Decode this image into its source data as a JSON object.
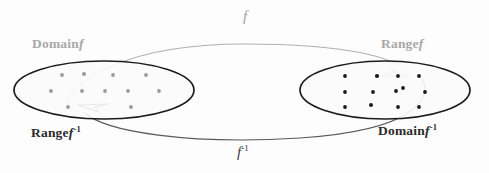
{
  "figure": {
    "colors": {
      "gray": "#a8a8a8",
      "dark": "#2c2c2c",
      "ellipse_stroke": "#1c1c1c",
      "ellipse_fill": "#fbfbfb",
      "curve_f": "#aaaaaa",
      "curve_f_inverse": "#555555",
      "dot_left": "#9a9a9a",
      "dot_right": "#1a1a1a",
      "background": "#fdfdfd"
    }
  },
  "labels": {
    "domain_f": {
      "word": "Domain",
      "symbol": "f",
      "exponent": ""
    },
    "range_f": {
      "word": "Range",
      "symbol": "f",
      "exponent": ""
    },
    "range_f_inverse": {
      "word": "Range",
      "symbol": "f",
      "exponent": "-1"
    },
    "domain_f_inverse": {
      "word": "Domain",
      "symbol": "f",
      "exponent": "-1"
    },
    "curve_top": {
      "symbol": "f",
      "exponent": ""
    },
    "curve_bottom": {
      "symbol": "f",
      "exponent": "-1"
    }
  },
  "left_set": {
    "name": "Domain f / Range f inverse",
    "ellipse": {
      "cx": 104,
      "cy": 90,
      "rx": 90,
      "ry": 29
    },
    "dots": [
      {
        "x": 62,
        "y": 75
      },
      {
        "x": 84,
        "y": 74
      },
      {
        "x": 113,
        "y": 75
      },
      {
        "x": 146,
        "y": 75
      },
      {
        "x": 51,
        "y": 91
      },
      {
        "x": 82,
        "y": 91
      },
      {
        "x": 105,
        "y": 91
      },
      {
        "x": 128,
        "y": 91
      },
      {
        "x": 159,
        "y": 91
      },
      {
        "x": 68,
        "y": 107
      },
      {
        "x": 131,
        "y": 107
      }
    ]
  },
  "right_set": {
    "name": "Range f / Domain f inverse",
    "ellipse": {
      "cx": 385,
      "cy": 90,
      "rx": 85,
      "ry": 29
    },
    "dots": [
      {
        "x": 345,
        "y": 76
      },
      {
        "x": 377,
        "y": 76
      },
      {
        "x": 398,
        "y": 76
      },
      {
        "x": 419,
        "y": 76
      },
      {
        "x": 345,
        "y": 92
      },
      {
        "x": 373,
        "y": 92
      },
      {
        "x": 396,
        "y": 91
      },
      {
        "x": 403,
        "y": 89
      },
      {
        "x": 425,
        "y": 92
      },
      {
        "x": 345,
        "y": 107
      },
      {
        "x": 371,
        "y": 105
      },
      {
        "x": 398,
        "y": 107
      },
      {
        "x": 419,
        "y": 107
      }
    ]
  },
  "arrows": {
    "f": {
      "description": "gray curve from left set arcing over top to right set",
      "label": "f"
    },
    "f_inverse": {
      "description": "dark curve from right set arcing under bottom to left set",
      "label": "f -1"
    }
  }
}
